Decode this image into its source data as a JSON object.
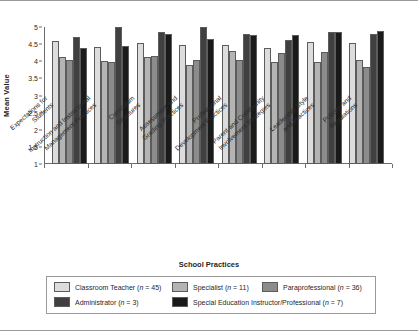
{
  "chart_data": {
    "type": "bar",
    "title": "",
    "xlabel": "School Practices",
    "ylabel": "Mean Value",
    "ylim": [
      1,
      5
    ],
    "yticks": [
      1,
      1.5,
      2,
      2.5,
      3,
      3.5,
      4,
      4.5,
      5
    ],
    "ytick_labels": [
      "1",
      "1.5",
      "2",
      "2.5",
      "3",
      "3.5",
      "4",
      "4.5",
      "5"
    ],
    "grid": false,
    "legend_position": "bottom",
    "categories": [
      "Expectations for Students",
      "Instruction and Instructional Management Practices",
      "Curriculum Structures",
      "Assessment and Grading Practices",
      "Professional Development Practices",
      "Parent and Community Involvement Strategies",
      "Leadership Style and Practices",
      "Policies and Regulations"
    ],
    "series": [
      {
        "name": "Classroom Teacher",
        "n": 45,
        "legend_label": "Classroom Teacher (n = 45)",
        "color": "#dcdcdc",
        "values": [
          4.58,
          4.42,
          4.52,
          4.47,
          4.48,
          4.38,
          4.57,
          4.52
        ]
      },
      {
        "name": "Specialist",
        "n": 11,
        "legend_label": "Specialist (n = 11)",
        "color": "#b4b4b4",
        "values": [
          4.12,
          4.0,
          4.12,
          3.88,
          4.3,
          3.99,
          3.99,
          4.04
        ]
      },
      {
        "name": "Paraprofessional",
        "n": 36,
        "legend_label": "Paraprofessional (n = 36)",
        "color": "#8c8c8c",
        "values": [
          4.05,
          3.98,
          4.16,
          4.05,
          4.03,
          4.25,
          4.26,
          3.83
        ]
      },
      {
        "name": "Administrator",
        "n": 3,
        "legend_label": "Administrator (n = 3)",
        "color": "#404040",
        "values": [
          4.7,
          5.0,
          4.84,
          5.0,
          4.81,
          4.62,
          4.86,
          4.79
        ]
      },
      {
        "name": "Special Education Instructor/Professional",
        "n": 7,
        "legend_label": "Special Education Instructor/Professional (n = 7)",
        "color": "#1a1a1a",
        "values": [
          4.4,
          4.44,
          4.79,
          4.64,
          4.78,
          4.76,
          4.86,
          4.88
        ]
      }
    ]
  },
  "axis": {
    "y_title": "Mean Value",
    "x_title": "School Practices"
  }
}
